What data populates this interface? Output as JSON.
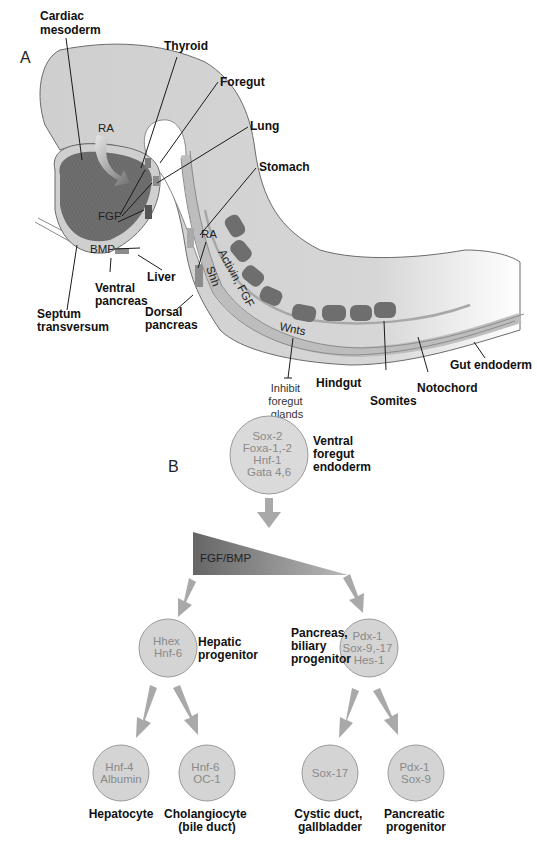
{
  "panel_a": {
    "label": "A",
    "structures": {
      "cardiac_mesoderm": [
        "Cardiac",
        "mesoderm"
      ],
      "thyroid": "Thyroid",
      "foregut": "Foregut",
      "lung": "Lung",
      "stomach": "Stomach",
      "liver": "Liver",
      "ventral_pancreas": [
        "Ventral",
        "pancreas"
      ],
      "septum_transversum": [
        "Septum",
        "transversum"
      ],
      "dorsal_pancreas": [
        "Dorsal",
        "pancreas"
      ],
      "hindgut": "Hindgut",
      "somites": "Somites",
      "notochord": "Notochord",
      "gut_endoderm": "Gut endoderm"
    },
    "signals": {
      "ra_top": "RA",
      "fgf": "FGF",
      "bmp": "BMP",
      "ra_dorsal": "RA",
      "shh": "Shh",
      "activin_fgf": "Activin, FGF",
      "wnts": "Wnts"
    },
    "wnt_effect": [
      "Inhibit",
      "foregut",
      "glands"
    ],
    "colors": {
      "embryo_fill": "#cfcfcf",
      "embryo_outline": "#6b6b6b",
      "heart_fill": "#6a6a6a",
      "somite_fill": "#6e6e6e",
      "notochord": "#a8a8a8"
    }
  },
  "panel_b": {
    "label": "B",
    "gradient_label": "FGF/BMP",
    "nodes": {
      "root": {
        "genes": [
          "Sox-2",
          "Foxa-1,-2",
          "Hnf-1",
          "Gata 4,6"
        ],
        "name": [
          "Ventral",
          "foregut",
          "endoderm"
        ]
      },
      "hepatic": {
        "genes": [
          "Hhex",
          "Hnf-6"
        ],
        "name": [
          "Hepatic",
          "progenitor"
        ]
      },
      "pancreas_biliary": {
        "genes": [
          "Pdx-1",
          "Sox-9,-17",
          "Hes-1"
        ],
        "name": [
          "Pancreas,",
          "biliary",
          "progenitor"
        ]
      },
      "hepatocyte": {
        "genes": [
          "Hnf-4",
          "Albumin"
        ],
        "name": [
          "Hepatocyte"
        ]
      },
      "cholangiocyte": {
        "genes": [
          "Hnf-6",
          "OC-1"
        ],
        "name": [
          "Cholangiocyte",
          "(bile duct)"
        ]
      },
      "cystic": {
        "genes": [
          "Sox-17"
        ],
        "name": [
          "Cystic duct,",
          "gallbladder"
        ]
      },
      "pancreatic": {
        "genes": [
          "Pdx-1",
          "Sox-9"
        ],
        "name": [
          "Pancreatic",
          "progenitor"
        ]
      }
    },
    "colors": {
      "node_fill": "#d4d4d4",
      "node_stroke": "#9a9a9a",
      "arrow": "#a9a9a9",
      "gradient_dark": "#6a6a6a",
      "gradient_light": "#c9c9c9"
    }
  }
}
